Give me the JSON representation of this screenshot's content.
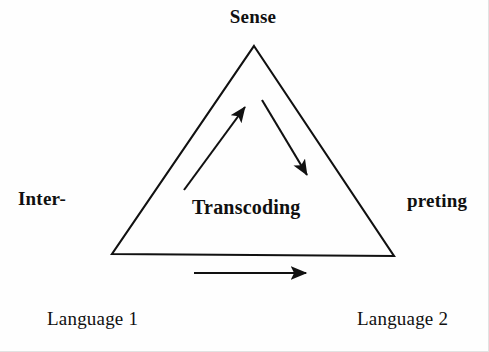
{
  "diagram": {
    "background_color": "#fefefe",
    "stroke_color": "#111111",
    "text_color": "#101010",
    "labels": {
      "apex": "Sense",
      "left_side": "Inter-",
      "right_side": "preting",
      "center": "Transcoding",
      "bottom_left": "Language 1",
      "bottom_right": "Language 2"
    },
    "shapes": {
      "triangle": {
        "name": "interpreting-triangle",
        "apex": [
          254,
          46
        ],
        "bottom_left": [
          112,
          254
        ],
        "bottom_right": [
          394,
          256
        ],
        "stroke_width": 2
      },
      "arrows": [
        {
          "name": "comprehension-arrow",
          "direction": "up-right",
          "from": [
            184,
            190
          ],
          "to": [
            248,
            103
          ]
        },
        {
          "name": "reformulation-arrow",
          "direction": "down-right",
          "from": [
            262,
            100
          ],
          "to": [
            310,
            180
          ]
        },
        {
          "name": "transcoding-arrow",
          "direction": "right",
          "from": [
            194,
            273
          ],
          "to": [
            312,
            273
          ]
        }
      ]
    }
  }
}
